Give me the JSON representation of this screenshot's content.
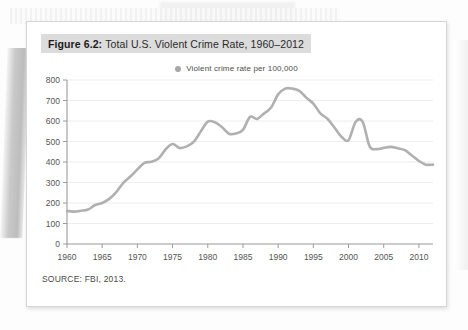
{
  "figure": {
    "number_label": "Figure 6.2:",
    "title": "Total U.S. Violent Crime Rate, 1960–2012",
    "source": "SOURCE: FBI, 2013."
  },
  "legend": {
    "marker_icon": "circle-marker-icon",
    "label": "Violent crime rate per 100,000",
    "marker_color": "#a8a8a8"
  },
  "colors": {
    "line": "#b0b0b0",
    "grid": "#ededed",
    "axis": "#9a9a9a",
    "banner": "#dcdcdc",
    "card": "#ffffff",
    "text": "#4d4d4d"
  },
  "chart_data": {
    "type": "line",
    "title": "Total U.S. Violent Crime Rate, 1960–2012",
    "xlabel": "",
    "ylabel": "",
    "xlim": [
      1960,
      2012
    ],
    "ylim": [
      0,
      800
    ],
    "grid": true,
    "legend_position": "top-center",
    "xticks": [
      1960,
      1965,
      1970,
      1975,
      1980,
      1985,
      1990,
      1995,
      2000,
      2005,
      2010
    ],
    "yticks": [
      0,
      100,
      200,
      300,
      400,
      500,
      600,
      700,
      800
    ],
    "series": [
      {
        "name": "Violent crime rate per 100,000",
        "x": [
          1960,
          1961,
          1962,
          1963,
          1964,
          1965,
          1966,
          1967,
          1968,
          1969,
          1970,
          1971,
          1972,
          1973,
          1974,
          1975,
          1976,
          1977,
          1978,
          1979,
          1980,
          1981,
          1982,
          1983,
          1984,
          1985,
          1986,
          1987,
          1988,
          1989,
          1990,
          1991,
          1992,
          1993,
          1994,
          1995,
          1996,
          1997,
          1998,
          1999,
          2000,
          2001,
          2002,
          2003,
          2004,
          2005,
          2006,
          2007,
          2008,
          2009,
          2010,
          2011,
          2012
        ],
        "values": [
          161,
          158,
          162,
          168,
          190,
          200,
          220,
          253,
          298,
          329,
          364,
          396,
          401,
          417,
          461,
          488,
          468,
          476,
          498,
          549,
          597,
          594,
          571,
          538,
          539,
          557,
          620,
          610,
          637,
          666,
          730,
          758,
          758,
          747,
          714,
          685,
          637,
          611,
          568,
          523,
          507,
          595,
          597,
          476,
          463,
          469,
          474,
          467,
          458,
          432,
          405,
          387,
          387
        ]
      }
    ]
  },
  "axis": {
    "ytick_labels": [
      "800",
      "700",
      "600",
      "500",
      "400",
      "300",
      "200",
      "100",
      "0"
    ],
    "xtick_labels": [
      "1960",
      "1965",
      "1970",
      "1975",
      "1980",
      "1985",
      "1990",
      "1995",
      "2000",
      "2005",
      "2010"
    ]
  }
}
